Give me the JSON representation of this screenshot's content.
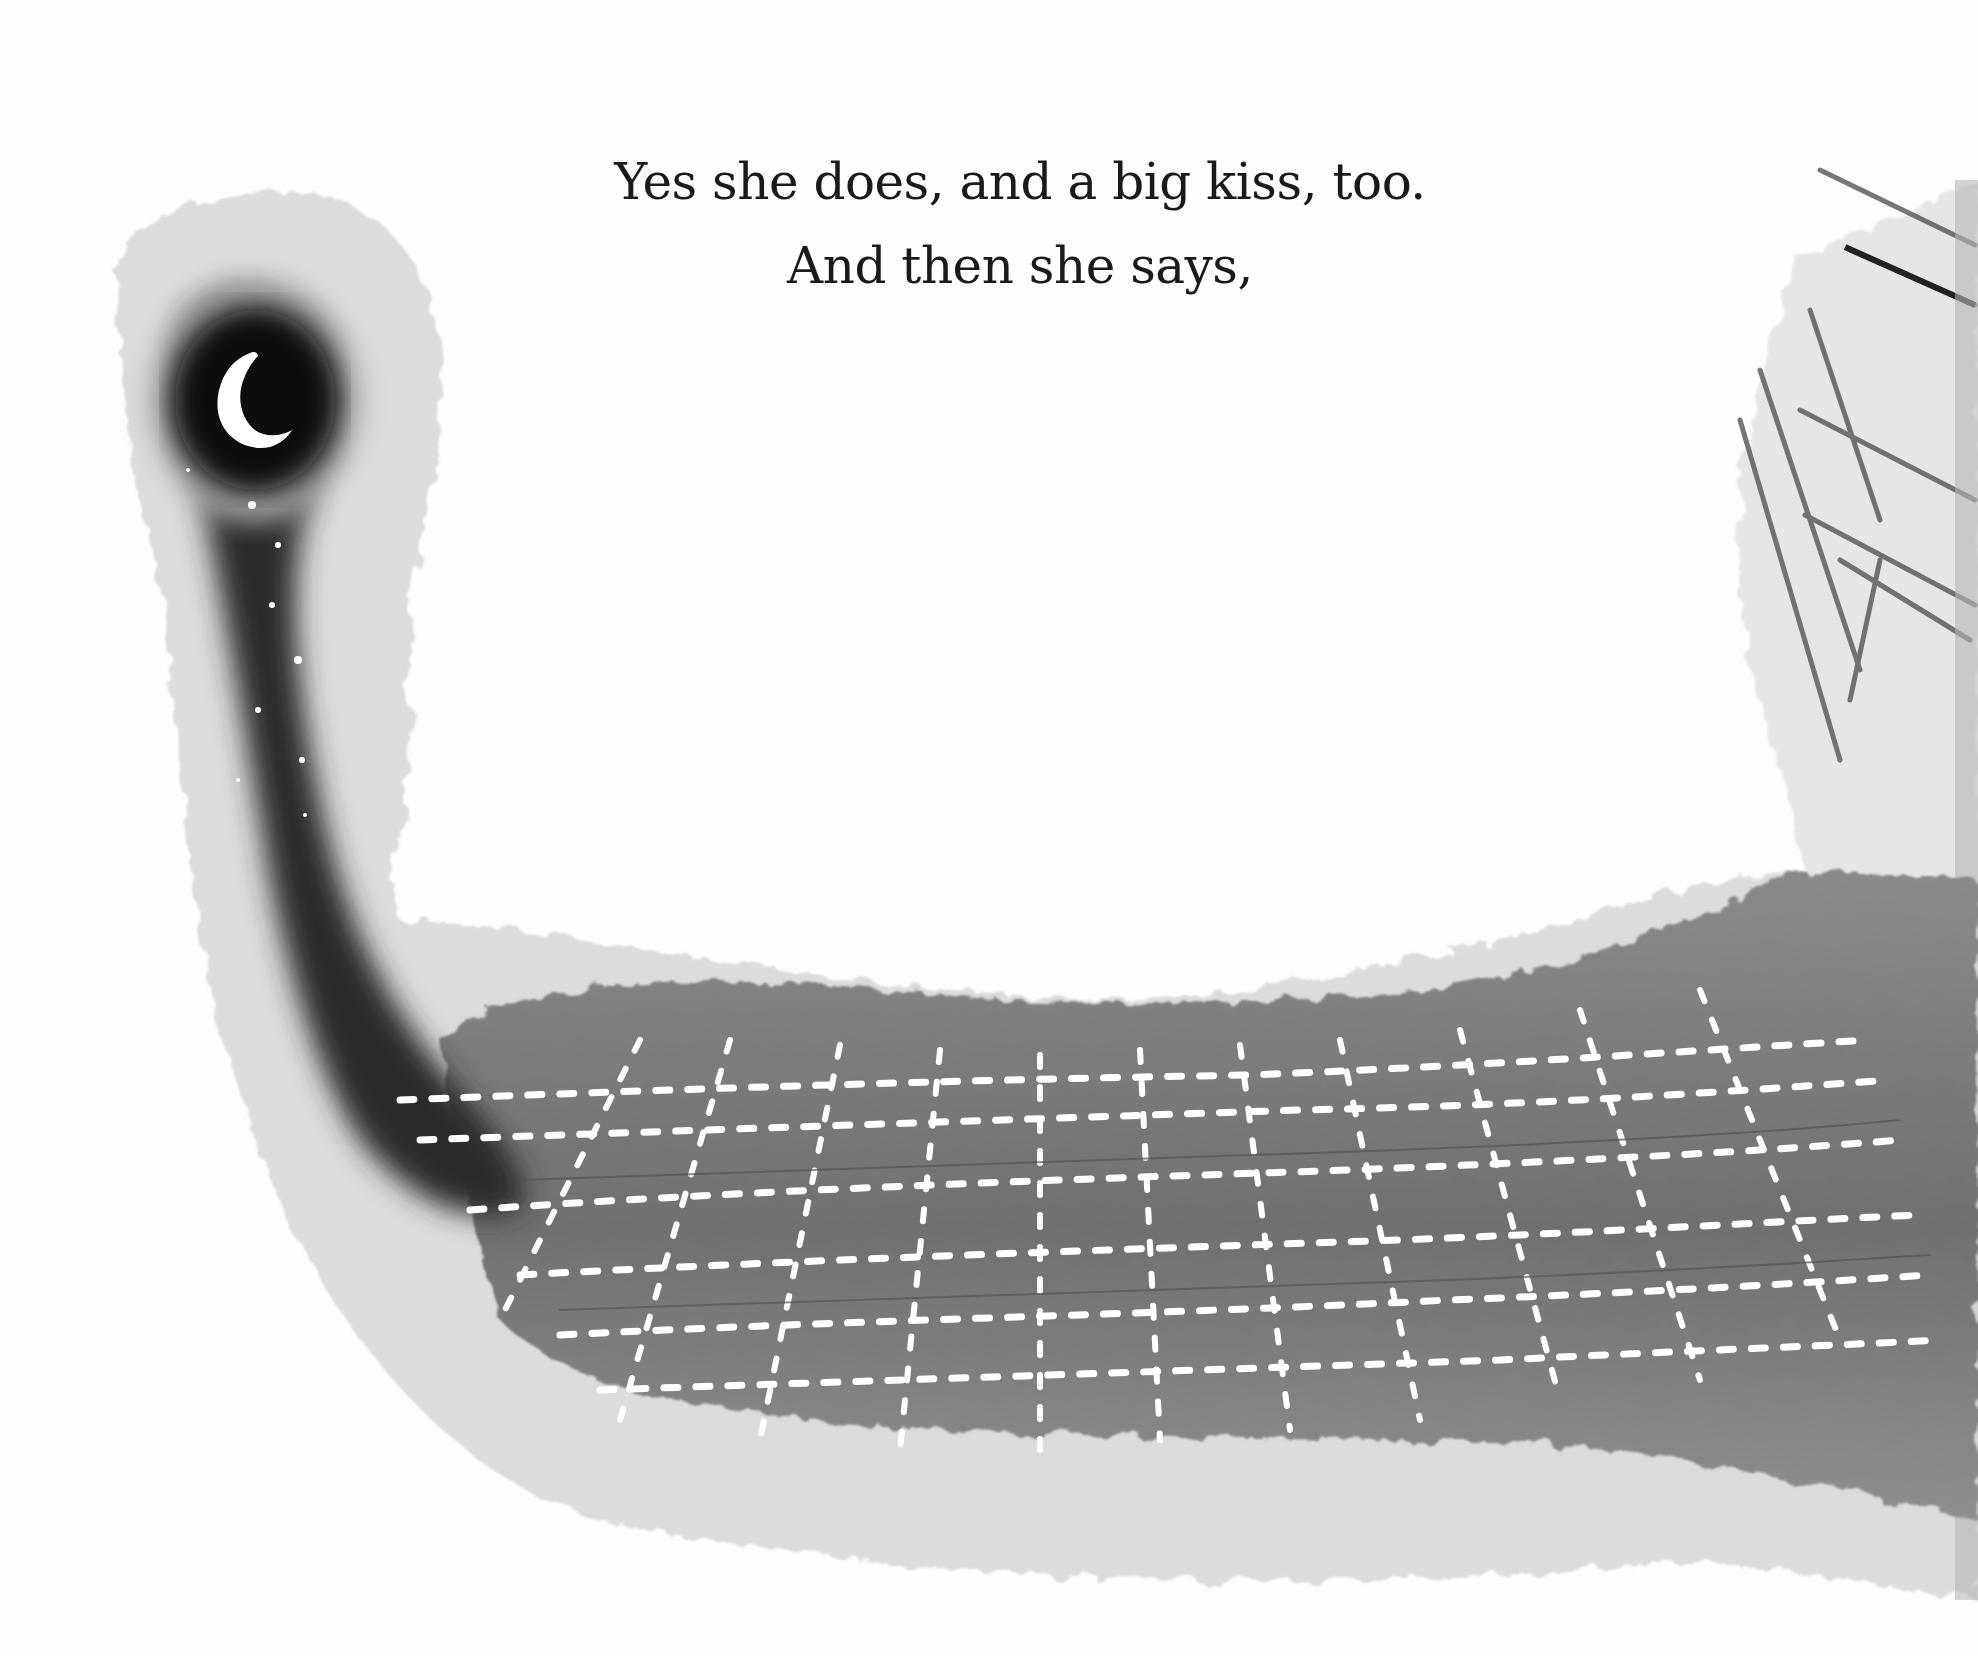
{
  "page": {
    "type": "picture-book spread",
    "text_lines": [
      "Yes she does, and a big kiss, too.",
      "And then she says,"
    ]
  },
  "illustration": {
    "style": "monochrome ink wash",
    "elements": [
      {
        "name": "night-sky-column",
        "description": "dark ink wash column rising on left"
      },
      {
        "name": "crescent-moon",
        "description": "white crescent moon at top of dark column"
      },
      {
        "name": "stars",
        "description": "small white dots falling down the dark column"
      },
      {
        "name": "city-grid",
        "description": "grey wash with white dashed street grid in perspective"
      },
      {
        "name": "building-edge",
        "description": "pencil-sketched wall edge on right"
      }
    ],
    "colors": {
      "paper": "#fefefe",
      "ink_dark": "#0c0c0c",
      "wash_mid": "#7a7a7a",
      "wash_light": "#c8c8c8",
      "grid_lines": "#ffffff",
      "text": "#1a1a1a"
    }
  }
}
